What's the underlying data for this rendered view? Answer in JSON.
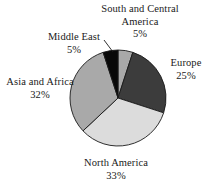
{
  "chart_data": {
    "type": "pie",
    "title": "",
    "subtitle": "",
    "xlabel": "",
    "ylabel": "",
    "legend_position": "none",
    "grid": false,
    "labels_inline": true,
    "categories": [
      "South and Central America",
      "Europe",
      "North America",
      "Asia and Africa",
      "Middle East"
    ],
    "values": [
      5,
      25,
      33,
      32,
      5
    ],
    "value_suffix": "%",
    "slices": [
      {
        "label": "South and Central America",
        "value": 5,
        "value_text": "5%",
        "color": "#a9a9a9",
        "start_angle_deg": 0,
        "end_angle_deg": 18
      },
      {
        "label": "Europe",
        "value": 25,
        "value_text": "25%",
        "color": "#3c3c3c",
        "start_angle_deg": 18,
        "end_angle_deg": 108
      },
      {
        "label": "North America",
        "value": 33,
        "value_text": "33%",
        "color": "#dcdcdc",
        "start_angle_deg": 108,
        "end_angle_deg": 226.8
      },
      {
        "label": "Asia and Africa",
        "value": 32,
        "value_text": "32%",
        "color": "#a9a9a9",
        "start_angle_deg": 226.8,
        "end_angle_deg": 342
      },
      {
        "label": "Middle East",
        "value": 5,
        "value_text": "5%",
        "color": "#080808",
        "start_angle_deg": 342,
        "end_angle_deg": 360
      }
    ],
    "geometry": {
      "center_x": 118,
      "center_y": 98,
      "radius": 48
    },
    "outline_color": "#1a1a1a",
    "background": "#ffffff"
  },
  "labels": {
    "south_central_america": {
      "name": "South and Central America",
      "value": "5%"
    },
    "middle_east": {
      "name": "Middle East",
      "value": "5%"
    },
    "europe": {
      "name": "Europe",
      "value": "25%"
    },
    "asia_africa": {
      "name": "Asia and Africa",
      "value": "32%"
    },
    "north_america": {
      "name": "North America",
      "value": "33%"
    }
  }
}
